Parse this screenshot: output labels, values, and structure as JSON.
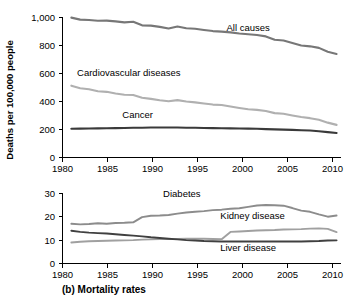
{
  "figure": {
    "caption": "(b) Mortality rates",
    "ylabel_top": "Deaths per 100,000 people"
  },
  "colors": {
    "all_causes": "#777777",
    "cardiovascular": "#b0b0b0",
    "cancer": "#3a3a3a",
    "diabetes": "#8c8c8c",
    "kidney": "#a0a0a0",
    "liver": "#404040",
    "axis": "#000000",
    "background": "#ffffff"
  },
  "chart_data": [
    {
      "type": "line",
      "panel": "top",
      "title": "",
      "xlabel": "",
      "ylabel": "Deaths per 100,000 people",
      "xlim": [
        1980,
        2011.5
      ],
      "ylim": [
        0,
        1000
      ],
      "xticks": [
        1980,
        1985,
        1990,
        1995,
        2000,
        2005,
        2010
      ],
      "xticklabels": [
        "1980",
        "1985",
        "1990",
        "1995",
        "2000",
        "2005",
        "2010"
      ],
      "yticks": [
        0,
        200,
        400,
        600,
        800,
        1000
      ],
      "yticklabels": [
        "0",
        "200",
        "400",
        "600",
        "800",
        "1,000"
      ],
      "grid": false,
      "legend": "inline-annotations",
      "x": [
        1981,
        1982,
        1983,
        1984,
        1985,
        1986,
        1987,
        1988,
        1989,
        1990,
        1991,
        1992,
        1993,
        1994,
        1995,
        1996,
        1997,
        1998,
        1999,
        2000,
        2001,
        2002,
        2003,
        2004,
        2005,
        2006,
        2007,
        2008,
        2009,
        2010,
        2011
      ],
      "series": [
        {
          "name": "All causes",
          "color": "#777777",
          "label_x": 2001,
          "label_y": 905,
          "values": [
            999,
            985,
            982,
            977,
            978,
            972,
            965,
            970,
            944,
            942,
            933,
            922,
            936,
            923,
            920,
            911,
            903,
            899,
            894,
            886,
            880,
            875,
            865,
            841,
            836,
            818,
            800,
            794,
            783,
            755,
            740
          ]
        },
        {
          "name": "Cardiovascular diseases",
          "color": "#b0b0b0",
          "label_x": 1987.5,
          "label_y": 585,
          "values": [
            513,
            495,
            487,
            473,
            469,
            457,
            448,
            446,
            427,
            419,
            409,
            402,
            410,
            400,
            394,
            386,
            378,
            375,
            364,
            354,
            345,
            340,
            332,
            317,
            312,
            300,
            289,
            281,
            269,
            249,
            233
          ]
        },
        {
          "name": "Cancer",
          "color": "#3a3a3a",
          "label_x": 1988.5,
          "label_y": 285,
          "values": [
            205,
            206,
            207,
            208,
            209,
            210,
            211,
            212,
            213,
            214,
            214,
            214,
            214,
            213,
            212,
            211,
            210,
            209,
            208,
            207,
            206,
            205,
            203,
            201,
            199,
            197,
            195,
            193,
            188,
            181,
            175
          ]
        }
      ]
    },
    {
      "type": "line",
      "panel": "bottom",
      "title": "",
      "xlabel": "",
      "ylabel": "",
      "xlim": [
        1980,
        2011.5
      ],
      "ylim": [
        0,
        30
      ],
      "xticks": [
        1980,
        1985,
        1990,
        1995,
        2000,
        2005,
        2010
      ],
      "xticklabels": [
        "1980",
        "1985",
        "1990",
        "1995",
        "2000",
        "2005",
        "2010"
      ],
      "yticks": [
        0,
        10,
        20,
        30
      ],
      "yticklabels": [
        "0",
        "10",
        "20",
        "30"
      ],
      "grid": false,
      "legend": "inline-annotations",
      "x": [
        1981,
        1982,
        1983,
        1984,
        1985,
        1986,
        1987,
        1988,
        1989,
        1990,
        1991,
        1992,
        1993,
        1994,
        1995,
        1996,
        1997,
        1998,
        1999,
        2000,
        2001,
        2002,
        2003,
        2004,
        2005,
        2006,
        2007,
        2008,
        2009,
        2010,
        2011
      ],
      "series": [
        {
          "name": "Diabetes",
          "color": "#8c8c8c",
          "label_x": 1993.5,
          "label_y": 28.3,
          "values": [
            17.0,
            16.7,
            16.9,
            17.2,
            17.0,
            17.3,
            17.4,
            17.6,
            19.8,
            20.4,
            20.5,
            20.7,
            21.3,
            21.8,
            22.1,
            22.4,
            22.8,
            23.0,
            23.4,
            23.6,
            24.2,
            24.8,
            25.0,
            24.9,
            24.7,
            23.7,
            22.6,
            22.1,
            21.0,
            20.0,
            20.5
          ]
        },
        {
          "name": "Kidney disease",
          "color": "#a0a0a0",
          "label_x": 2001.5,
          "label_y": 19.0,
          "values": [
            9.0,
            9.3,
            9.5,
            9.6,
            9.7,
            9.8,
            9.9,
            10.0,
            10.2,
            10.3,
            10.4,
            10.4,
            10.5,
            10.6,
            10.6,
            10.6,
            10.5,
            10.4,
            13.5,
            13.7,
            13.9,
            14.1,
            14.2,
            14.3,
            14.5,
            14.6,
            14.7,
            14.9,
            15.0,
            14.8,
            13.4
          ]
        },
        {
          "name": "Liver disease",
          "color": "#404040",
          "label_x": 2001,
          "label_y": 5.3,
          "values": [
            14.0,
            13.5,
            13.2,
            13.0,
            12.8,
            12.5,
            12.2,
            11.9,
            11.6,
            11.2,
            10.9,
            10.6,
            10.3,
            10.0,
            9.8,
            9.6,
            9.5,
            9.4,
            9.4,
            9.4,
            9.4,
            9.4,
            9.4,
            9.4,
            9.4,
            9.4,
            9.4,
            9.5,
            9.6,
            9.8,
            9.9
          ]
        }
      ]
    }
  ]
}
